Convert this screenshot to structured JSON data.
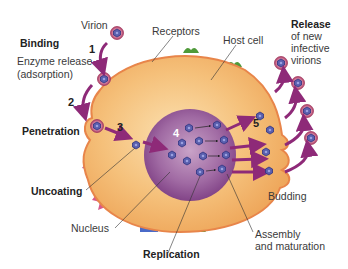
{
  "labels": {
    "virion": "Virion",
    "receptors": "Receptors",
    "host_cell": "Host cell",
    "binding": "Binding",
    "enzyme_release_1": "Enzyme release",
    "enzyme_release_2": "(adsorption)",
    "penetration": "Penetration",
    "uncoating": "Uncoating",
    "nucleus": "Nucleus",
    "replication": "Replication",
    "assembly_1": "Assembly",
    "assembly_2": "and maturation",
    "budding": "Budding",
    "release_1": "Release",
    "release_2": "of new",
    "release_3": "infective",
    "release_4": "virions"
  },
  "steps": [
    "1",
    "2",
    "3",
    "4",
    "5"
  ],
  "colors": {
    "cytoplasm": "#f3b96a",
    "membrane": "#e8854a",
    "nucleus": "#8a4a8e",
    "arrow": "#8e2a78",
    "virion": "#c2557a",
    "capsid": "#5a5fae",
    "receptor_green": "#4f9a3a"
  }
}
